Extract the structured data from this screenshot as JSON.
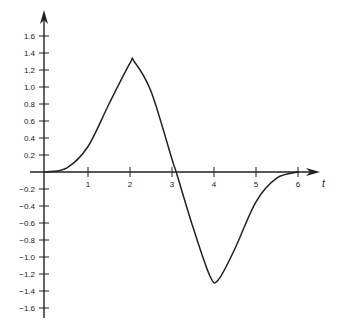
{
  "chart_data": {
    "type": "line",
    "title": "",
    "xlabel": "t",
    "ylabel": "",
    "xlim": [
      0,
      6.5
    ],
    "ylim": [
      -1.7,
      1.7
    ],
    "grid": false,
    "legend": null,
    "x_ticks": [
      "1",
      "2",
      "3",
      "4",
      "5",
      "6"
    ],
    "y_ticks": [
      "1.6",
      "1.4",
      "1.2",
      "1.0",
      "0.8",
      "0.6",
      "0.4",
      "0.2",
      "-0.2",
      "-0.4",
      "-0.6",
      "-0.8",
      "-1.0",
      "-1.2",
      "-1.4",
      "-1.6"
    ],
    "series": [
      {
        "name": "curve",
        "x": [
          0,
          0.5,
          1.0,
          1.5,
          2.0,
          2.1,
          2.5,
          3.0,
          3.1,
          3.5,
          3.9,
          4.1,
          4.5,
          5.0,
          5.5,
          6.0
        ],
        "y": [
          0,
          0.05,
          0.3,
          0.8,
          1.28,
          1.3,
          0.95,
          0.15,
          0.0,
          -0.65,
          -1.22,
          -1.27,
          -0.9,
          -0.35,
          -0.07,
          0
        ]
      }
    ],
    "annotations": []
  }
}
